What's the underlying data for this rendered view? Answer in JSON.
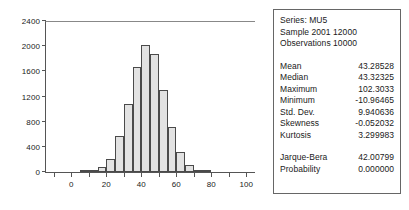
{
  "chart_data": {
    "type": "bar",
    "title": "",
    "xlabel": "",
    "ylabel": "",
    "xlim": [
      -15,
      105
    ],
    "ylim": [
      0,
      2400
    ],
    "grid": false,
    "legend": false,
    "bin_width": 5,
    "y_ticks": [
      0,
      400,
      800,
      1200,
      1600,
      2000,
      2400
    ],
    "x_ticks": [
      0,
      20,
      40,
      60,
      80,
      100
    ],
    "x_minor_ticks": [
      -10,
      10,
      30,
      50,
      70,
      90
    ],
    "bin_starts": [
      5,
      10,
      15,
      20,
      25,
      30,
      35,
      40,
      45,
      50,
      55,
      60,
      65,
      70,
      75
    ],
    "bin_centers": [
      7.5,
      12.5,
      17.5,
      22.5,
      27.5,
      32.5,
      37.5,
      42.5,
      47.5,
      52.5,
      57.5,
      62.5,
      67.5,
      72.5,
      77.5
    ],
    "values": [
      10,
      30,
      80,
      210,
      580,
      1080,
      1675,
      2020,
      1870,
      1300,
      715,
      325,
      110,
      25,
      8
    ]
  },
  "stats": {
    "header": [
      "Series: MU5",
      "Sample 2001 12000",
      "Observations 10000"
    ],
    "rows": [
      {
        "label": "Mean",
        "value": "43.28528"
      },
      {
        "label": "Median",
        "value": "43.32325"
      },
      {
        "label": "Maximum",
        "value": "102.3033"
      },
      {
        "label": "Minimum",
        "value": "-10.96465"
      },
      {
        "label": "Std. Dev.",
        "value": "9.940636"
      },
      {
        "label": "Skewness",
        "value": "-0.052032"
      },
      {
        "label": "Kurtosis",
        "value": "3.299983"
      }
    ],
    "test_rows": [
      {
        "label": "Jarque-Bera",
        "value": "42.00799"
      },
      {
        "label": "Probability",
        "value": "0.000000"
      }
    ]
  },
  "colors": {
    "bar_fill": "#e2e2e2",
    "bar_stroke": "#4a4a4a",
    "axis": "#555555",
    "panel_border": "#666666",
    "text": "#1a1a1a",
    "background": "#ffffff"
  }
}
